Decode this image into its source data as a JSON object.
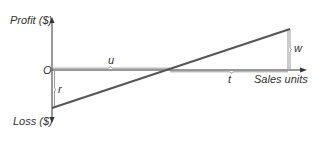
{
  "diagram": {
    "type": "break-even chart",
    "y_axis_top_label": "Profit ($)",
    "y_axis_bottom_label": "Loss ($)",
    "origin_label": "O",
    "x_axis_label": "Sales units",
    "brackets": {
      "u": "u",
      "t": "t",
      "w": "w",
      "r": "r"
    },
    "colors": {
      "axis": "#333333",
      "line": "#555555",
      "bracket": "#999999"
    }
  }
}
